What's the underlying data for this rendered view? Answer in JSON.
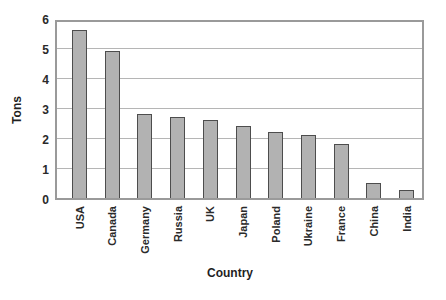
{
  "chart_data": {
    "type": "bar",
    "title": "",
    "xlabel": "Country",
    "ylabel": "Tons",
    "categories": [
      "USA",
      "Canada",
      "Germany",
      "Russia",
      "UK",
      "Japan",
      "Poland",
      "Ukraine",
      "France",
      "China",
      "India"
    ],
    "values": [
      5.6,
      4.9,
      2.8,
      2.7,
      2.6,
      2.4,
      2.2,
      2.1,
      1.8,
      0.5,
      0.25
    ],
    "ylim": [
      0,
      6
    ],
    "yticks": [
      0,
      1,
      2,
      3,
      4,
      5,
      6
    ],
    "grid": "horizontal-only",
    "legend": "none",
    "colors": {
      "bar_fill": "#b2b2b2",
      "bar_border": "#4d4d4d",
      "plot_border": "#9a9a9a",
      "gridline": "#b5b5b5",
      "text": "#2a2a2a",
      "background": "#ffffff"
    }
  }
}
